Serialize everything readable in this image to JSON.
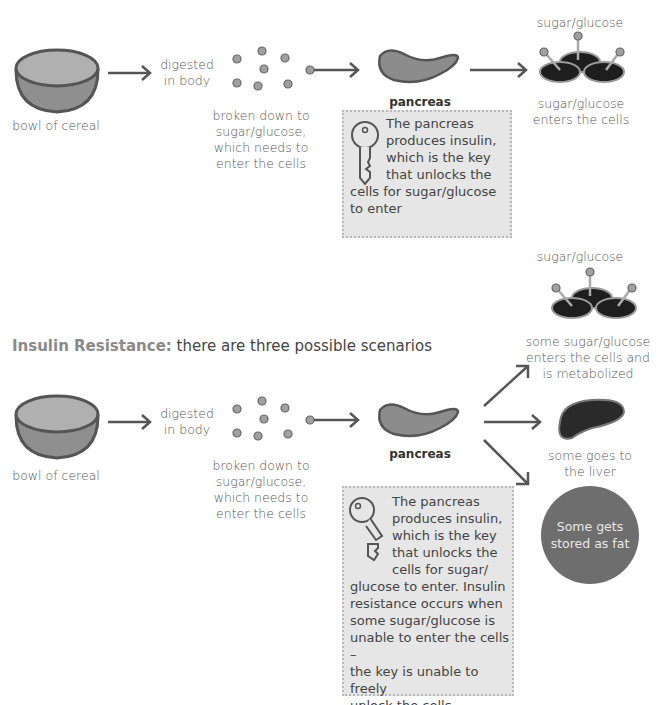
{
  "colors": {
    "bowl_top": "#b0b0b0",
    "bowl_body": "#8f8f8f",
    "outline": "#555555",
    "glucose_dot": "#a0a0a0",
    "pancreas": "#8c8c8c",
    "liver": "#2a2a2a",
    "fat_circle": "#6e6e6e",
    "note_box": "#e6e6e6",
    "heading_accent": "#8a8a8a"
  },
  "normal": {
    "bowl_label": "bowl of cereal",
    "digested_label": [
      "digested",
      "in body"
    ],
    "broken_down_label": [
      "broken down to",
      "sugar/glucose,",
      "which needs to",
      "enter the cells"
    ],
    "pancreas_label": "pancreas",
    "cells_top_label": "sugar/glucose",
    "cells_bottom_label": [
      "sugar/glucose",
      "enters the cells"
    ],
    "note_icon": "key-icon",
    "note_lines": [
      "The pancreas",
      "produces insulin,",
      "which is the key",
      "that unlocks the",
      "cells for sugar/glucose",
      "to enter"
    ]
  },
  "resistance": {
    "heading_bold": "Insulin Resistance:",
    "heading_rest": " there are three possible scenarios",
    "bowl_label": "bowl of cereal",
    "digested_label": [
      "digested",
      "in body"
    ],
    "broken_down_label": [
      "broken down to",
      "sugar/glucose,",
      "which needs to",
      "enter the cells"
    ],
    "pancreas_label": "pancreas",
    "cells_top_label": "sugar/glucose",
    "cells_bottom_label": [
      "some sugar/glucose",
      "enters the cells and",
      "is metabolized"
    ],
    "liver_label": [
      "some goes to",
      "the liver"
    ],
    "fat_label": [
      "Some gets",
      "stored as fat"
    ],
    "note_icon": "broken-key-icon",
    "note_lines": [
      "The pancreas",
      "produces insulin,",
      "which is the key",
      "that unlocks the",
      "cells for sugar/",
      "glucose to enter.  Insulin",
      "resistance occurs when",
      "some sugar/glucose is",
      "unable to enter the cells –",
      "the key is unable to freely",
      "unlock the cells"
    ]
  }
}
